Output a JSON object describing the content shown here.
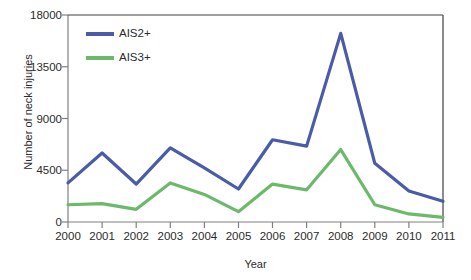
{
  "chart_data": {
    "type": "line",
    "title": "",
    "xlabel": "Year",
    "ylabel": "Number of neck injuries",
    "categories": [
      "2000",
      "2001",
      "2002",
      "2003",
      "2004",
      "2005",
      "2006",
      "2007",
      "2008",
      "2009",
      "2010",
      "2011"
    ],
    "x": [
      2000,
      2001,
      2002,
      2003,
      2004,
      2005,
      2006,
      2007,
      2008,
      2009,
      2010,
      2011
    ],
    "xlim": [
      2000,
      2011
    ],
    "ylim": [
      0,
      18000
    ],
    "yticks": [
      0,
      4500,
      9000,
      13500,
      18000
    ],
    "ytick_labels": [
      "0",
      "4500",
      "9000",
      "13500",
      "18000"
    ],
    "grid": false,
    "legend_position": "upper-left-inside",
    "series": [
      {
        "name": "AIS2+",
        "color": "#4A5BA8",
        "values": [
          3400,
          6000,
          3300,
          6450,
          4700,
          2870,
          7150,
          6600,
          16400,
          5100,
          2700,
          1800
        ]
      },
      {
        "name": "AIS3+",
        "color": "#6BB96B",
        "values": [
          1500,
          1600,
          1100,
          3400,
          2400,
          900,
          3300,
          2800,
          6300,
          1500,
          700,
          400
        ]
      }
    ]
  },
  "axes": {
    "ylabel": "Number of neck injuries",
    "xlabel": "Year",
    "ytick_labels": [
      "18000",
      "13500",
      "9000",
      "4500",
      "0"
    ],
    "xtick_labels": [
      "2000",
      "2001",
      "2002",
      "2003",
      "2004",
      "2005",
      "2006",
      "2007",
      "2008",
      "2009",
      "2010",
      "2011"
    ]
  },
  "legend": {
    "items": [
      {
        "label": "AIS2+",
        "color": "#4A5BA8"
      },
      {
        "label": "AIS3+",
        "color": "#6BB96B"
      }
    ]
  },
  "style": {
    "axis_color": "#808080",
    "text_color": "#2b2b2b",
    "background": "#ffffff"
  }
}
